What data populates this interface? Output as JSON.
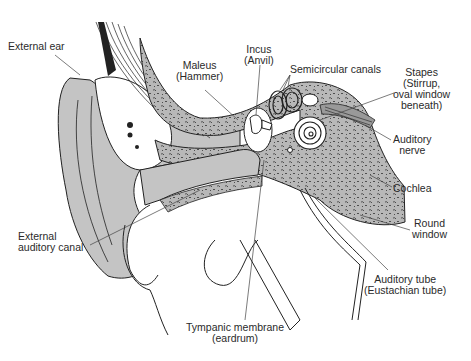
{
  "colors": {
    "background": "#ffffff",
    "tissue_gray": "#c4c4c4",
    "bone_gray": "#b8b8b8",
    "line": "#222222",
    "label_text": "#2a2a2a"
  },
  "labels": {
    "external_ear": "External ear",
    "maleus": "Maleus\n(Hammer)",
    "incus": "Incus\n(Anvil)",
    "semicircular_canals": "Semicircular canals",
    "stapes": "Stapes\n(Stirrup,\noval window\nbeneath)",
    "auditory_nerve": "Auditory\nnerve",
    "cochlea": "Cochlea",
    "round_window": "Round\nwindow",
    "external_auditory_canal": "External\nauditory canal",
    "auditory_tube": "Auditory tube\n(Eustachian tube)",
    "tympanic_membrane": "Tympanic membrane\n(eardrum)"
  }
}
